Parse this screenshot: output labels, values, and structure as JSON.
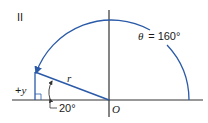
{
  "diagram": {
    "quadrant_label": "II",
    "angle_label": "θ = 160°",
    "angle_symbol": "θ",
    "angle_value": "= 160°",
    "vector_label": "r",
    "y_component_label": "+y",
    "reference_angle_label": "20°",
    "origin_label": "O",
    "colors": {
      "vector": "#2a5aa8",
      "arc": "#2a5aa8",
      "axes": "#333333",
      "text": "#1a1a1a"
    }
  }
}
